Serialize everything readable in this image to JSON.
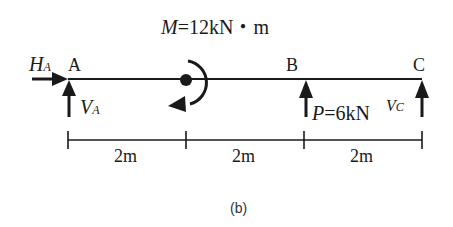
{
  "diagram": {
    "caption": "(b)",
    "points": {
      "a": "A",
      "b": "B",
      "c": "C"
    },
    "moment": {
      "symbol": "M",
      "equals": "=",
      "value": "12kN・m",
      "direction": "counterclockwise"
    },
    "load_p": {
      "symbol": "P",
      "equals": "=",
      "value": "6kN"
    },
    "reactions": {
      "ha": {
        "symbol": "H",
        "subscript": "A"
      },
      "va": {
        "symbol": "V",
        "subscript": "A"
      },
      "vc": {
        "symbol": "V",
        "subscript": "C"
      }
    },
    "dimensions": [
      "2m",
      "2m",
      "2m"
    ],
    "colors": {
      "stroke": "#1a1a1a",
      "background": "#ffffff"
    }
  }
}
